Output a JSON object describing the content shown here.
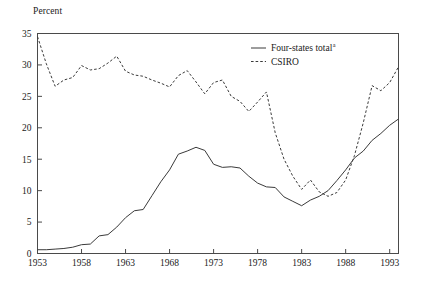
{
  "chart_data": {
    "type": "line",
    "title": "",
    "subtitle": "",
    "xlabel": "",
    "ylabel": "Percent",
    "ylim": [
      0,
      35
    ],
    "xlim": [
      1953,
      1994
    ],
    "yticks": [
      0,
      5,
      10,
      15,
      20,
      25,
      30,
      35
    ],
    "ytick_labels": [
      "0",
      "5",
      "10",
      "15",
      "20",
      "25",
      "30",
      "35"
    ],
    "xticks": [
      1953,
      1958,
      1963,
      1968,
      1973,
      1978,
      1983,
      1988,
      1993
    ],
    "xtick_labels": [
      "1953",
      "1958",
      "1963",
      "1968",
      "1973",
      "1978",
      "1983",
      "1988",
      "1993"
    ],
    "grid": false,
    "legend_position": "top-right",
    "legend": [
      {
        "label": "Four-states total",
        "superscript": "a",
        "style": "solid",
        "color": "#3a3a3a"
      },
      {
        "label": "CSIRO",
        "superscript": "",
        "style": "dashed",
        "color": "#3a3a3a"
      }
    ],
    "x": [
      1953,
      1954,
      1955,
      1956,
      1957,
      1958,
      1959,
      1960,
      1961,
      1962,
      1963,
      1964,
      1965,
      1966,
      1967,
      1968,
      1969,
      1970,
      1971,
      1972,
      1973,
      1974,
      1975,
      1976,
      1977,
      1978,
      1979,
      1980,
      1981,
      1982,
      1983,
      1984,
      1985,
      1986,
      1987,
      1988,
      1989,
      1990,
      1991,
      1992,
      1993,
      1994
    ],
    "series": [
      {
        "name": "Four-states total",
        "style": "solid",
        "color": "#3a3a3a",
        "values": [
          0.6,
          0.6,
          0.7,
          0.8,
          1.0,
          1.4,
          1.5,
          2.8,
          3.0,
          4.2,
          5.7,
          6.8,
          7.0,
          9.2,
          11.4,
          13.3,
          15.8,
          16.3,
          16.9,
          16.4,
          14.2,
          13.7,
          13.8,
          13.6,
          12.3,
          11.2,
          10.6,
          10.5,
          9.0,
          8.3,
          7.6,
          8.5,
          9.1,
          10.0,
          11.6,
          13.3,
          15.2,
          16.3,
          18.0,
          19.1,
          20.4,
          21.4
        ]
      },
      {
        "name": "CSIRO",
        "style": "dashed",
        "color": "#3a3a3a",
        "values": [
          34.5,
          30.2,
          26.6,
          27.6,
          28.0,
          29.9,
          29.2,
          29.4,
          30.3,
          31.4,
          29.0,
          28.4,
          28.2,
          27.6,
          27.1,
          26.5,
          28.3,
          29.1,
          27.3,
          25.4,
          27.2,
          27.6,
          25.0,
          24.2,
          22.6,
          24.1,
          25.7,
          19.2,
          15.0,
          12.3,
          10.2,
          11.7,
          9.8,
          9.1,
          9.7,
          11.7,
          15.6,
          20.8,
          26.7,
          25.9,
          27.2,
          29.7
        ]
      }
    ]
  },
  "axes": {
    "y_label_text": "Percent"
  }
}
